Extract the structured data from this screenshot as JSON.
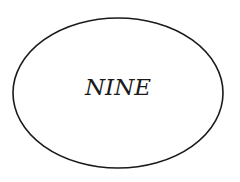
{
  "diagram": {
    "shape": "ellipse",
    "label": "NINE",
    "stroke_color": "#1a1a1a",
    "fill_color": "#ffffff"
  }
}
